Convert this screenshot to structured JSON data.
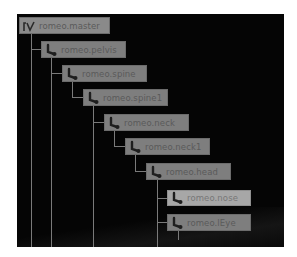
{
  "hierarchy": {
    "nodes": [
      {
        "label": "romeo.master",
        "icon": "master-curve-icon",
        "depth": 0
      },
      {
        "label": "romeo.pelvis",
        "icon": "joint-icon",
        "depth": 1
      },
      {
        "label": "romeo.spine",
        "icon": "joint-icon",
        "depth": 2
      },
      {
        "label": "romeo.spine1",
        "icon": "joint-icon",
        "depth": 3
      },
      {
        "label": "romeo.neck",
        "icon": "joint-icon",
        "depth": 4
      },
      {
        "label": "romeo.neck1",
        "icon": "joint-icon",
        "depth": 5
      },
      {
        "label": "romeo.head",
        "icon": "joint-icon",
        "depth": 6
      },
      {
        "label": "romeo.nose",
        "icon": "joint-icon",
        "depth": 7,
        "selected": true
      },
      {
        "label": "romeo.lEye",
        "icon": "joint-icon",
        "depth": 7
      }
    ]
  },
  "colors": {
    "background": "#050505",
    "node": "#7e7e7e",
    "node_selected": "#a7a7a7",
    "connector": "#7a7a7a"
  }
}
